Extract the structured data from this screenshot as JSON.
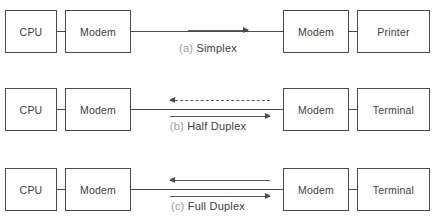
{
  "diagram": {
    "line_color": "#4a4a4a",
    "caption_color": "#7d7d7d",
    "background": "#ffffff",
    "rows": [
      {
        "id": "simplex",
        "caption_tag": "(a)",
        "caption_name": "Simplex",
        "nodes": {
          "source": "CPU",
          "modem_left": "Modem",
          "modem_right": "Modem",
          "destination": "Printer"
        },
        "arrows": [
          {
            "direction": "right",
            "style": "solid",
            "position": "on-wire"
          }
        ]
      },
      {
        "id": "half-duplex",
        "caption_tag": "(b)",
        "caption_name": "Half Duplex",
        "nodes": {
          "source": "CPU",
          "modem_left": "Modem",
          "modem_right": "Modem",
          "destination": "Terminal"
        },
        "arrows": [
          {
            "direction": "left",
            "style": "dashed",
            "position": "above"
          },
          {
            "direction": "right",
            "style": "solid",
            "position": "below"
          }
        ]
      },
      {
        "id": "full-duplex",
        "caption_tag": "(c)",
        "caption_name": "Full Duplex",
        "nodes": {
          "source": "CPU",
          "modem_left": "Modem",
          "modem_right": "Modem",
          "destination": "Terminal"
        },
        "arrows": [
          {
            "direction": "left",
            "style": "solid",
            "position": "above"
          },
          {
            "direction": "right",
            "style": "solid",
            "position": "below"
          }
        ]
      }
    ]
  }
}
